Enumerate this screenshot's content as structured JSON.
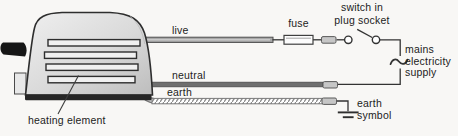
{
  "labels": {
    "live": "live",
    "neutral": "neutral",
    "earth": "earth",
    "fuse": "fuse",
    "switch": "switch in\nplug socket",
    "mains_supply": "mains\nelectricity\nsupply",
    "earth_symbol": "earth\nsymbol",
    "heating_element": "heating element"
  },
  "colors": {
    "background": "#f8f7f5",
    "outline": "#2e2e2e",
    "toaster_fill": "#d9d9d9",
    "live_wire": "#a8a8a8",
    "neutral_wire": "#6f6f6f",
    "earth_wire_hatch": "#8a8a8a",
    "connector": "#c6c6c6",
    "text": "#1c1c1c"
  }
}
